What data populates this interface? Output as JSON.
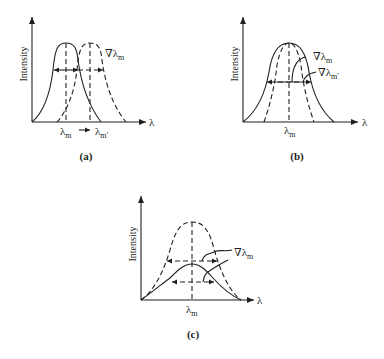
{
  "figure": {
    "panels": [
      {
        "id": "a",
        "caption": "(a)",
        "y_axis_label": "Intensity",
        "x_axis_label": "λ",
        "peak_labels": [
          "λm",
          "λm'"
        ],
        "shift_arrow": "→",
        "width_label": "∇λm",
        "description": "Two identical peaks; dashed peak shifted from λm to λm'"
      },
      {
        "id": "b",
        "caption": "(b)",
        "y_axis_label": "Intensity",
        "x_axis_label": "λ",
        "peak_labels": [
          "λm"
        ],
        "width_labels": [
          "∇λm",
          "∇λm'"
        ],
        "description": "Same peak position; solid peak broadened relative to dashed"
      },
      {
        "id": "c",
        "caption": "(c)",
        "y_axis_label": "Intensity",
        "x_axis_label": "λ",
        "peak_labels": [
          "λm"
        ],
        "width_label": "∇λm",
        "description": "Same peak position; solid peak has reduced intensity"
      }
    ]
  }
}
